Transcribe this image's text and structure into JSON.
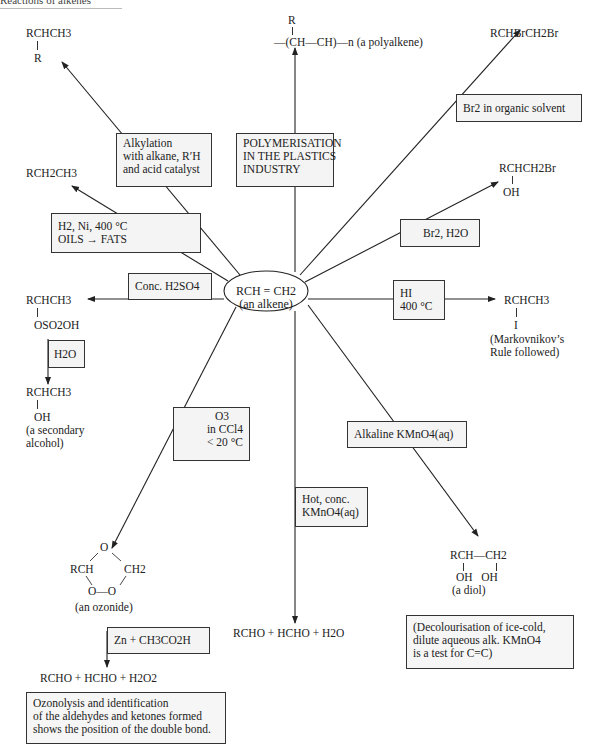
{
  "header": {
    "title": "Reactions of alkenes"
  },
  "center": {
    "line1": "RCH = CH2",
    "line2": "(an alkene)"
  },
  "products": {
    "alkylation": {
      "main": "RCHCH3",
      "sub": "R"
    },
    "polymer": {
      "top": "R",
      "main": "—(CH—CH)—n",
      "note": "(a polyalkene)"
    },
    "dibromide": {
      "main": "RCHBrCH2Br"
    },
    "bromohydrin": {
      "main": "RCHCH2Br",
      "sub": "OH"
    },
    "alkane": {
      "main": "RCH2CH3"
    },
    "alkyl_hydrogensulfate": {
      "main": "RCHCH3",
      "sub": "OSO2OH"
    },
    "secondary_alcohol": {
      "main": "RCHCH3",
      "sub": "OH",
      "note1": "(a secondary",
      "note2": "alcohol)"
    },
    "iodoalkane": {
      "main": "RCHCH3",
      "sub": "I",
      "note1": "(Markovnikov’s",
      "note2": "Rule followed)"
    },
    "ozonide": {
      "top": "O",
      "left": "RCH",
      "right": "CH2",
      "bottom": "O—O",
      "note": "(an ozonide)"
    },
    "hot_kmno4": {
      "main": "RCHO + HCHO + H2O"
    },
    "diol": {
      "left": "RCH—CH2",
      "sub": "OH   OH",
      "note": "(a diol)"
    },
    "ozonolysis": {
      "main": "RCHO + HCHO + H2O2"
    }
  },
  "conditions": {
    "alkylation": [
      "Alkylation",
      "with alkane, R′H",
      "and acid catalyst"
    ],
    "polymerisation": [
      "POLYMERISATION",
      "IN THE PLASTICS",
      "INDUSTRY"
    ],
    "br2_solvent": [
      "Br2 in organic solvent"
    ],
    "br2_water": [
      "Br2, H2O"
    ],
    "hydrogenation": [
      "H2, Ni, 400 °C",
      "OILS → FATS"
    ],
    "conc_h2so4": [
      "Conc. H2SO4"
    ],
    "water": [
      "H2O"
    ],
    "hi": [
      "HI",
      "400 °C"
    ],
    "ozone": [
      "O3",
      "in CCl4",
      "< 20 °C"
    ],
    "alkaline_kmno4": [
      "Alkaline KMnO4(aq)"
    ],
    "hot_kmno4": [
      "Hot, conc.",
      "KMnO4(aq)"
    ],
    "zinc": [
      "Zn + CH3CO2H"
    ]
  },
  "notes": {
    "decolourisation": [
      "(Decolourisation of ice-cold,",
      "dilute aqueous alk. KMnO4",
      "is a test for C=C)"
    ],
    "ozonolysis": [
      "Ozonolysis and identification",
      "of the aldehydes and ketones formed",
      "shows the position of the double bond."
    ]
  }
}
